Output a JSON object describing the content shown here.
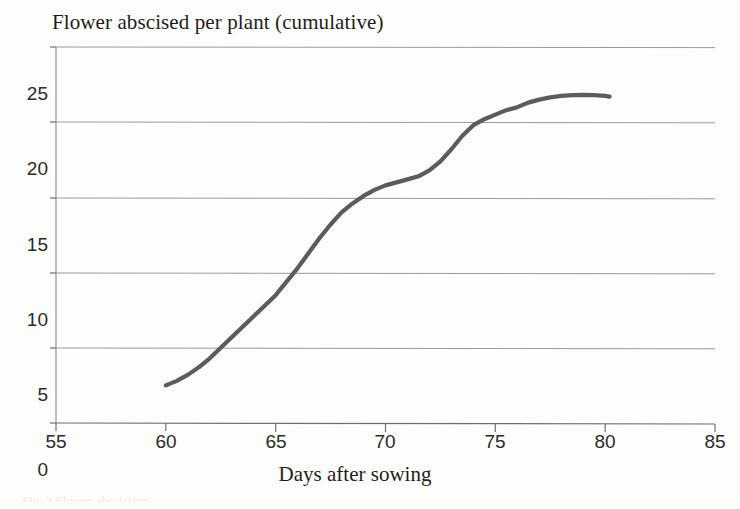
{
  "chart_data": {
    "type": "line",
    "title": "Flower abscised per plant (cumulative)",
    "xlabel": "Days after sowing",
    "ylabel": "",
    "xlim": [
      55,
      85
    ],
    "ylim": [
      0,
      25
    ],
    "xticks": [
      55,
      60,
      65,
      70,
      75,
      80,
      85
    ],
    "yticks": [
      0,
      5,
      10,
      15,
      20,
      25
    ],
    "grid": "horizontal",
    "legend": "none",
    "line_color": "#5c5c5c",
    "grid_color": "#8c8c8c",
    "series": [
      {
        "name": "Flower abscised per plant (cumulative)",
        "x": [
          60.0,
          60.5,
          61.0,
          61.5,
          62.0,
          62.5,
          63.0,
          63.5,
          64.0,
          64.5,
          65.0,
          65.5,
          66.0,
          66.5,
          67.0,
          67.5,
          68.0,
          68.5,
          69.0,
          69.5,
          70.0,
          70.5,
          71.0,
          71.5,
          72.0,
          72.5,
          73.0,
          73.5,
          74.0,
          74.5,
          75.0,
          75.5,
          76.0,
          76.5,
          77.0,
          77.5,
          78.0,
          78.5,
          79.0,
          79.5,
          80.0,
          80.2
        ],
        "y": [
          2.5,
          2.8,
          3.2,
          3.7,
          4.3,
          5.0,
          5.7,
          6.4,
          7.1,
          7.8,
          8.5,
          9.4,
          10.3,
          11.3,
          12.3,
          13.2,
          14.0,
          14.6,
          15.1,
          15.5,
          15.8,
          16.0,
          16.2,
          16.4,
          16.8,
          17.4,
          18.2,
          19.1,
          19.8,
          20.2,
          20.5,
          20.8,
          21.0,
          21.3,
          21.5,
          21.65,
          21.75,
          21.8,
          21.82,
          21.8,
          21.75,
          21.7
        ]
      }
    ]
  },
  "axes": {
    "y_tick_labels": [
      "25",
      "20",
      "15",
      "10",
      "5",
      "0"
    ],
    "x_tick_labels": [
      "55",
      "60",
      "65",
      "70",
      "75",
      "80",
      "85"
    ]
  },
  "caption": {
    "remnant": "Fig. 3 Flower abscission"
  }
}
